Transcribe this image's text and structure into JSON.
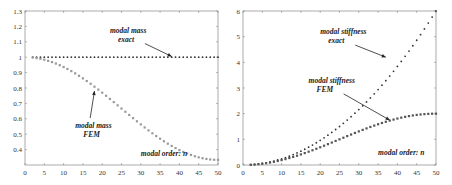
{
  "chart_data": [
    {
      "type": "scatter",
      "title": "",
      "xlabel": "modal order: n",
      "ylabel": "",
      "xlim": [
        0,
        50
      ],
      "ylim": [
        0.3,
        1.3
      ],
      "xticks": [
        0,
        5,
        10,
        15,
        20,
        25,
        30,
        35,
        40,
        45,
        50
      ],
      "yticks": [
        0.4,
        0.5,
        0.6,
        0.7,
        0.8,
        0.9,
        1,
        1.1,
        1.2,
        1.3
      ],
      "ytick_labels": [
        "0.4",
        "0.5",
        "0.6",
        "0.7",
        "0.8",
        "0.9",
        "1",
        "1.1",
        "1.2",
        "1.3"
      ],
      "grid": false,
      "series": [
        {
          "name": "modal mass exact",
          "formula": "1",
          "x_range": [
            2,
            50
          ],
          "values_sample": {
            "2": 1,
            "25": 1,
            "50": 1
          }
        },
        {
          "name": "modal mass FEM",
          "formula": "(2+cos(pi*n/50))/3",
          "x_range": [
            2,
            50
          ],
          "values_sample": {
            "2": 0.997,
            "10": 0.968,
            "20": 0.872,
            "25": 0.667,
            "30": 0.563,
            "40": 0.397,
            "50": 0.333
          }
        }
      ],
      "annotations": [
        {
          "text": [
            "modal mass",
            "exact"
          ],
          "x": 22,
          "y": 1.16,
          "arrow_to": [
            38,
            1.005
          ]
        },
        {
          "text": [
            "modal mass",
            "FEM"
          ],
          "x": 13,
          "y": 0.54,
          "arrow_to": [
            18,
            0.78
          ]
        },
        {
          "text": [
            "modal order: n"
          ],
          "x": 30,
          "y": 0.36
        }
      ]
    },
    {
      "type": "scatter",
      "title": "",
      "xlabel": "modal order: n",
      "ylabel": "",
      "xlim": [
        0,
        50
      ],
      "ylim": [
        0,
        6
      ],
      "xticks": [
        0,
        5,
        10,
        15,
        20,
        25,
        30,
        35,
        40,
        45,
        50
      ],
      "yticks": [
        0,
        1,
        2,
        3,
        4,
        5,
        6
      ],
      "ytick_labels": [
        "0",
        "1",
        "2",
        "3",
        "4",
        "5",
        "6"
      ],
      "grid": false,
      "series": [
        {
          "name": "modal stiffness exact",
          "formula": "6*(n/50)^2",
          "x_range": [
            2,
            50
          ],
          "values_sample": {
            "10": 0.24,
            "20": 0.96,
            "30": 2.16,
            "40": 3.84,
            "50": 6
          }
        },
        {
          "name": "modal stiffness FEM",
          "formula": "1-cos(pi*n/50)",
          "x_range": [
            2,
            50
          ],
          "values_sample": {
            "10": 0.19,
            "20": 0.69,
            "25": 1.0,
            "30": 1.31,
            "40": 1.81,
            "50": 2
          }
        }
      ],
      "annotations": [
        {
          "text": [
            "modal stiffness",
            "exact"
          ],
          "x": 20,
          "y": 5.1,
          "arrow_to": [
            37,
            4.2
          ]
        },
        {
          "text": [
            "modal stiffness",
            "FEM"
          ],
          "x": 17,
          "y": 3.2,
          "arrow_to": [
            38,
            1.75
          ]
        },
        {
          "text": [
            "modal order: n"
          ],
          "x": 35,
          "y": 0.4
        }
      ]
    }
  ],
  "layout": {
    "panels": [
      {
        "left": 25,
        "top": 11,
        "right": 218,
        "bottom": 165
      },
      {
        "left": 243,
        "top": 11,
        "right": 436,
        "bottom": 165
      }
    ]
  }
}
